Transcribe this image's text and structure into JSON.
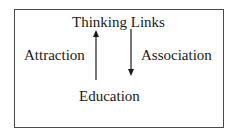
{
  "diagram": {
    "title": "Thinking Links",
    "nodes": {
      "left": "Attraction",
      "right": "Association",
      "bottom": "Education"
    },
    "edges": [
      {
        "from": "Education",
        "to": "Thinking Links",
        "direction": "up",
        "label": "Attraction"
      },
      {
        "from": "Thinking Links",
        "to": "Education",
        "direction": "down",
        "label": "Association"
      }
    ],
    "colors": {
      "line": "#1a1a1a",
      "border": "#4a4a4a",
      "background": "#ffffff"
    }
  }
}
